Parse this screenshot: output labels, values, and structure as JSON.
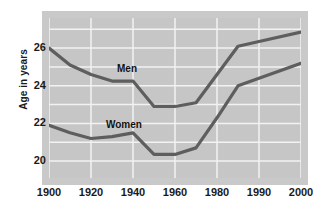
{
  "chart_data": {
    "type": "line",
    "title": "",
    "xlabel": "",
    "ylabel": "Age in years",
    "grid": true,
    "legend_position": "inline-annotations",
    "x_tick_labels": [
      "1900",
      "1920",
      "1940",
      "1960",
      "1980",
      "1990",
      "2000"
    ],
    "x_tick_values": [
      1900,
      1920,
      1940,
      1960,
      1980,
      1990,
      2000
    ],
    "y_tick_labels": [
      "20",
      "22",
      "24",
      "26"
    ],
    "y_tick_values": [
      20,
      22,
      24,
      26
    ],
    "ylim": [
      19.1,
      27.6
    ],
    "series": [
      {
        "name": "Men",
        "color": "#5e5e5e",
        "x": [
          1900,
          1910,
          1920,
          1930,
          1940,
          1950,
          1960,
          1970,
          1980,
          1985,
          1990,
          2000
        ],
        "values": [
          26.0,
          25.1,
          24.6,
          24.25,
          24.25,
          22.9,
          22.9,
          23.1,
          24.6,
          26.1,
          26.35,
          26.85
        ]
      },
      {
        "name": "Women",
        "color": "#5e5e5e",
        "x": [
          1900,
          1910,
          1920,
          1930,
          1940,
          1950,
          1960,
          1970,
          1980,
          1985,
          1990,
          2000
        ],
        "values": [
          21.9,
          21.5,
          21.2,
          21.3,
          21.5,
          20.35,
          20.35,
          20.7,
          22.3,
          24.0,
          24.4,
          25.2
        ]
      }
    ],
    "annotations": [
      {
        "text": "Men",
        "x_px": 117,
        "y_px": 63
      },
      {
        "text": "Women",
        "x_px": 106,
        "y_px": 119
      }
    ],
    "colors": {
      "plot_background": "#c6c6c6",
      "frame_background": "#c9c9c9",
      "page_background": "#ffffff",
      "gridline": "#f2f2f2",
      "line": "#5e5e5e",
      "text": "#1a1a1a"
    }
  }
}
